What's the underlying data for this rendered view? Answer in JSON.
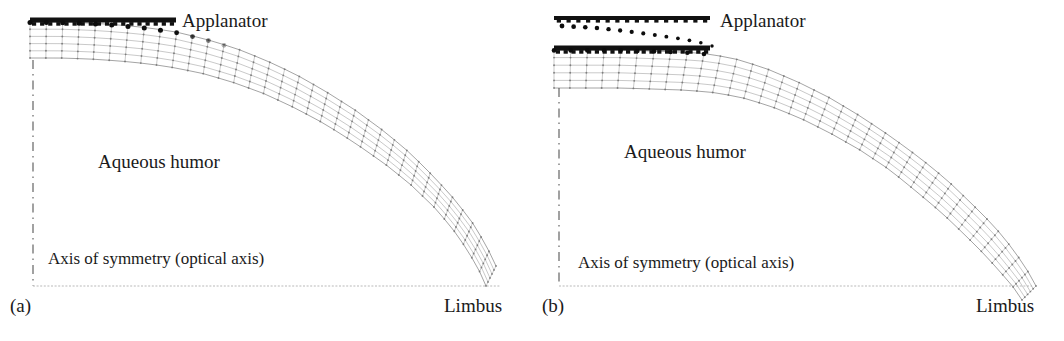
{
  "figure": {
    "background_color": "#ffffff",
    "ink_color": "#1a1a1a",
    "mesh_color": "#8e8e8e",
    "node_color": "#6a6a6a",
    "applanator_color": "#111111",
    "axis_color": "#555555",
    "panel_count": 2
  },
  "panels": [
    {
      "id": "a",
      "panel_label": "(a)",
      "applanator_label": "Applanator",
      "aqueous_label": "Aqueous humor",
      "axis_label": "Axis of symmetry (optical axis)",
      "limbus_label": "Limbus",
      "state": "initial contact",
      "contact_flat_width_px": 150,
      "applanator_bar": {
        "x1": 30,
        "y1": 20,
        "x2": 176,
        "y2": 20,
        "thickness": 5
      },
      "contact_nodes": 18,
      "mesh_layers": 5,
      "mesh_columns": 34,
      "axis_line": {
        "x": 33,
        "y_top": 60,
        "y_bottom": 286
      },
      "baseline": {
        "x1": 33,
        "y1": 286,
        "x2": 500,
        "y2": 286
      },
      "has_reference_outline": false
    },
    {
      "id": "b",
      "panel_label": "(b)",
      "applanator_label": "Applanator",
      "aqueous_label": "Aqueous humor",
      "axis_label": "Axis of symmetry (optical axis)",
      "limbus_label": "Limbus",
      "state": "deeper applanation",
      "contact_flat_width_px": 178,
      "applanator_bar": {
        "x1": 22,
        "y1": 48,
        "x2": 178,
        "y2": 48,
        "thickness": 5
      },
      "reference_bar": {
        "x1": 22,
        "y1": 18,
        "x2": 178,
        "y2": 18,
        "thickness": 4
      },
      "contact_nodes": 20,
      "mesh_layers": 5,
      "mesh_columns": 34,
      "axis_line": {
        "x": 27,
        "y_top": 88,
        "y_bottom": 286
      },
      "baseline": {
        "x1": 27,
        "y1": 286,
        "x2": 500,
        "y2": 286
      },
      "has_reference_outline": true,
      "reference_outline_dots": 14
    }
  ],
  "chart_data": {
    "type": "line",
    "xlabel": "Radial distance from optical axis",
    "ylabel": "Height",
    "grid": false,
    "legend_position": "none",
    "annotations": [
      "Applanator",
      "Aqueous humor",
      "Axis of symmetry (optical axis)",
      "Limbus",
      "(a)",
      "(b)"
    ],
    "series": [
      {
        "name": "panel-a-anterior-surface",
        "comment": "Anterior corneal surface, panel (a): flat under applanator then curving to limbus",
        "x": [
          30,
          60,
          90,
          120,
          150,
          176,
          205,
          235,
          265,
          295,
          325,
          355,
          385,
          410,
          435,
          455,
          472,
          486,
          496
        ],
        "y": [
          22,
          22,
          23,
          25,
          28,
          32,
          39,
          48,
          60,
          74,
          91,
          110,
          132,
          153,
          178,
          200,
          222,
          245,
          266
        ]
      },
      {
        "name": "panel-a-posterior-surface",
        "comment": "Posterior corneal surface, panel (a)",
        "x": [
          30,
          60,
          90,
          120,
          150,
          176,
          205,
          235,
          265,
          295,
          325,
          355,
          385,
          410,
          435,
          452,
          466,
          478,
          486
        ],
        "y": [
          58,
          58,
          59,
          61,
          64,
          68,
          74,
          83,
          94,
          108,
          124,
          143,
          164,
          184,
          208,
          228,
          248,
          268,
          286
        ]
      },
      {
        "name": "panel-b-anterior-surface",
        "comment": "Anterior corneal surface, panel (b): wider flat contact zone",
        "x": [
          22,
          55,
          88,
          120,
          150,
          178,
          208,
          238,
          268,
          298,
          328,
          358,
          388,
          415,
          440,
          462,
          480,
          494,
          504
        ],
        "y": [
          50,
          50,
          50,
          51,
          52,
          54,
          60,
          70,
          83,
          98,
          116,
          136,
          158,
          180,
          204,
          226,
          248,
          268,
          286
        ]
      },
      {
        "name": "panel-b-posterior-surface",
        "comment": "Posterior corneal surface, panel (b)",
        "x": [
          22,
          55,
          88,
          120,
          150,
          178,
          208,
          238,
          268,
          298,
          328,
          358,
          385,
          410,
          434,
          454,
          470,
          482,
          490
        ],
        "y": [
          88,
          88,
          88,
          89,
          90,
          92,
          97,
          106,
          118,
          133,
          150,
          170,
          192,
          213,
          236,
          256,
          274,
          288,
          300
        ]
      },
      {
        "name": "panel-b-reference-outline",
        "comment": "Dotted trace of the undeformed apex / prior applanator position in panel (b)",
        "x": [
          30,
          48,
          66,
          84,
          100,
          116,
          130,
          144,
          156,
          166,
          174,
          180
        ],
        "y": [
          22,
          23,
          24,
          26,
          28,
          30,
          32,
          34,
          36,
          38,
          40,
          42
        ]
      }
    ]
  }
}
